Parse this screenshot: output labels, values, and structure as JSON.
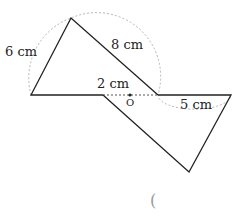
{
  "diagram": {
    "labels": {
      "side_top_left": "6 cm",
      "side_top_right": "8 cm",
      "center_segment": "2 cm",
      "side_right": "5 cm",
      "center_point": "O"
    },
    "answer_paren": "(",
    "colors": {
      "stroke": "#222222",
      "arc": "#b0b0b0",
      "dash": "#555555",
      "background": "#ffffff"
    }
  }
}
